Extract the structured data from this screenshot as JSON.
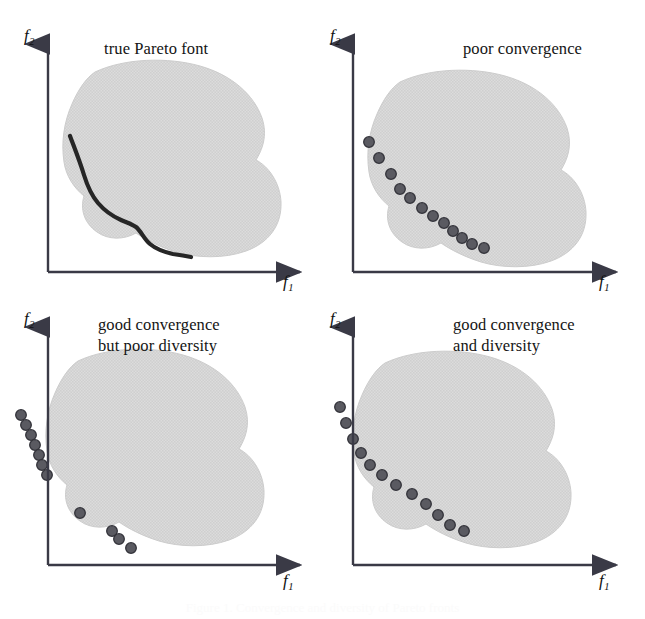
{
  "figure": {
    "caption": "Figure 1. Convergence and diversity of Pareto fronts",
    "axis": {
      "x_label_base": "f",
      "x_label_sub": "1",
      "y_label_base": "f",
      "y_label_sub": "2"
    },
    "colors": {
      "blob_fill": "#d6d6d6",
      "blob_edge": "#c9c9c9",
      "axis": "#3a3a46",
      "pareto_curve": "#262626",
      "point_fill": "#55555c",
      "point_edge": "#2e2e34",
      "background": "#ffffff",
      "text": "#141414"
    },
    "panels": [
      {
        "id": "true-pareto-front",
        "title": "true Pareto font",
        "position": "top-left",
        "shows_curve": true,
        "point_count": 0,
        "points": []
      },
      {
        "id": "poor-convergence",
        "title": "poor convergence",
        "position": "top-right",
        "shows_curve": false,
        "point_count": 12,
        "points": [
          [
            46,
            142
          ],
          [
            56,
            158
          ],
          [
            68,
            174
          ],
          [
            77,
            189
          ],
          [
            87,
            198
          ],
          [
            99,
            208
          ],
          [
            110,
            216
          ],
          [
            121,
            223
          ],
          [
            130,
            231
          ],
          [
            139,
            238
          ],
          [
            149,
            244
          ],
          [
            161,
            248
          ]
        ]
      },
      {
        "id": "good-convergence-poor-diversity",
        "title": "good convergence\nbut poor diversity",
        "position": "bottom-left",
        "shows_curve": false,
        "point_count": 11,
        "points": [
          [
            21,
            112
          ],
          [
            26,
            122
          ],
          [
            31,
            132
          ],
          [
            35,
            142
          ],
          [
            39,
            152
          ],
          [
            42,
            162
          ],
          [
            47,
            172
          ],
          [
            80,
            210
          ],
          [
            112,
            228
          ],
          [
            119,
            236
          ],
          [
            131,
            245
          ]
        ]
      },
      {
        "id": "good-convergence-and-diversity",
        "title": "good convergence\nand diversity",
        "position": "bottom-right",
        "shows_curve": false,
        "point_count": 12,
        "points": [
          [
            17,
            104
          ],
          [
            23,
            120
          ],
          [
            30,
            136
          ],
          [
            38,
            150
          ],
          [
            47,
            162
          ],
          [
            59,
            172
          ],
          [
            73,
            182
          ],
          [
            89,
            191
          ],
          [
            103,
            201
          ],
          [
            115,
            212
          ],
          [
            127,
            222
          ],
          [
            141,
            228
          ]
        ]
      }
    ]
  }
}
